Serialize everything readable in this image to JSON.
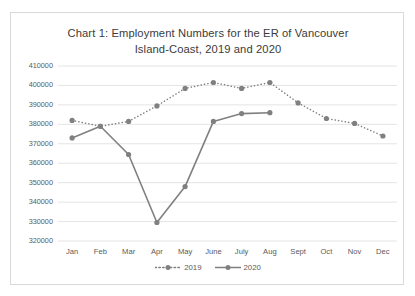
{
  "chart_data": {
    "type": "line",
    "title": "Chart 1: Employment Numbers for the ER of Vancouver Island-Coast, 2019 and 2020",
    "title_line1": "Chart 1: Employment Numbers for the ER of Vancouver",
    "title_line2": "Island-Coast, 2019 and 2020",
    "xlabel": "",
    "ylabel": "",
    "categories": [
      "Jan",
      "Feb",
      "Mar",
      "Apr",
      "May",
      "June",
      "July",
      "Aug",
      "Sept",
      "Oct",
      "Nov",
      "Dec"
    ],
    "ylim": [
      320000,
      410000
    ],
    "ytick_step": 10000,
    "ytick_labels": [
      "320000",
      "330000",
      "340000",
      "350000",
      "360000",
      "370000",
      "380000",
      "390000",
      "400000",
      "410000"
    ],
    "grid": true,
    "legend_position": "bottom",
    "series": [
      {
        "name": "2019",
        "style": "dotted",
        "color": "#808080",
        "values": [
          382000,
          379000,
          381500,
          389500,
          398500,
          401500,
          398500,
          401500,
          391000,
          383000,
          380500,
          374000
        ]
      },
      {
        "name": "2020",
        "style": "solid",
        "color": "#808080",
        "values": [
          373000,
          379000,
          364500,
          329500,
          348000,
          381500,
          385500,
          386000,
          null,
          null,
          null,
          null
        ]
      }
    ]
  },
  "legend": {
    "items": [
      {
        "label": "2019",
        "style": "dotted"
      },
      {
        "label": "2020",
        "style": "solid"
      }
    ]
  },
  "colors": {
    "series": "#808080",
    "grid": "#e4e4e4",
    "text": "#5a5a5a",
    "title": "#3b3b3b",
    "frame": "#d9d9d9"
  }
}
